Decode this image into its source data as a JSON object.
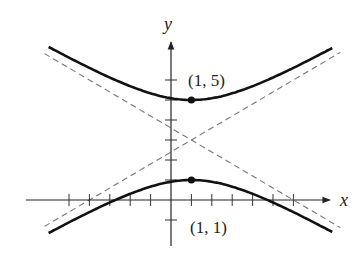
{
  "chart_data": {
    "type": "line",
    "title": "",
    "xlabel": "x",
    "ylabel": "y",
    "equation": "(y-3)^2/4 - (x-1)^2/(100/9) = 1",
    "center": [
      1,
      3
    ],
    "vertices": [
      [
        1,
        5
      ],
      [
        1,
        1
      ]
    ],
    "asymptotes": [
      "y - 3 = 3/5 (x - 1)",
      "y - 3 = -3/5 (x - 1)"
    ],
    "xlim": [
      -7.3,
      8.3
    ],
    "ylim": [
      -2.2,
      8.2
    ],
    "x_ticks": [
      -5,
      -4,
      -3,
      -2,
      -1,
      1,
      2,
      3,
      4,
      5,
      6
    ],
    "y_ticks": [
      -1,
      1,
      2,
      3,
      4,
      5,
      6
    ],
    "curve_x_range": [
      -6,
      7.9
    ],
    "grid": false,
    "annotations": [
      {
        "text": "(1, 5)",
        "point": [
          1,
          5
        ]
      },
      {
        "text": "(1, 1)",
        "point": [
          1,
          1
        ]
      }
    ]
  },
  "labels": {
    "x_axis": "x",
    "y_axis": "y",
    "upper_vertex": "(1, 5)",
    "lower_vertex": "(1, 1)"
  }
}
